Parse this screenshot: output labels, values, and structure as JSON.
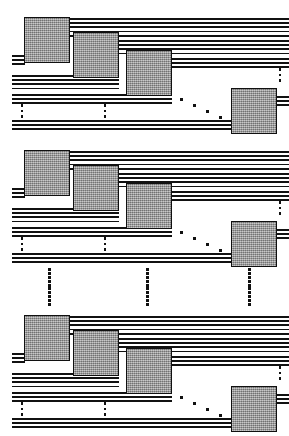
{
  "figure": {
    "type": "schematic-diagram",
    "width": 289,
    "height": 436,
    "background_color": "#ffffff",
    "line_color": "#111111",
    "box_fill_color": "#9a9a9a",
    "box_border_color": "#101010",
    "block_count": 3
  },
  "blocks": [
    {
      "id": "block-1",
      "label": "Stage 1",
      "y": 10,
      "height": 122,
      "boxes": [
        {
          "id": "pe-1-1",
          "label": "PE 1",
          "x": 24,
          "y": 7,
          "w": 46,
          "h": 46
        },
        {
          "id": "pe-1-2",
          "label": "PE 2",
          "x": 73,
          "y": 22,
          "w": 46,
          "h": 46
        },
        {
          "id": "pe-1-3",
          "label": "PE 3",
          "x": 126,
          "y": 40,
          "w": 46,
          "h": 46
        },
        {
          "id": "pe-1-4",
          "label": "PE n",
          "x": 231,
          "y": 78,
          "w": 46,
          "h": 46
        }
      ],
      "bus_groups": [
        {
          "id": "bus-top-1",
          "label": "Top bus group",
          "lines": 5,
          "x": 70,
          "y": 8,
          "w": 219,
          "spacing": 4.2
        },
        {
          "id": "bus-mid-1",
          "label": "Second bus group",
          "lines": 4,
          "x": 119,
          "y": 30,
          "w": 170,
          "spacing": 4.2
        },
        {
          "id": "bus-third-1",
          "label": "Third bus group",
          "lines": 3,
          "x": 172,
          "y": 48,
          "w": 117,
          "spacing": 4.2
        },
        {
          "id": "bus-left-1",
          "label": "Return bus group",
          "lines": 4,
          "x": 12,
          "y": 65,
          "w": 107,
          "spacing": 4.2
        },
        {
          "id": "bus-low-1",
          "label": "Lower bus group",
          "lines": 3,
          "x": 12,
          "y": 84,
          "w": 160,
          "spacing": 4.2
        },
        {
          "id": "bus-bottom-1",
          "label": "Bottom bus group",
          "lines": 3,
          "x": 12,
          "y": 110,
          "w": 219,
          "spacing": 4.2
        }
      ],
      "left_stubs": {
        "id": "stubs-left-1",
        "label": "Left input stubs",
        "lines": 3,
        "x": 12,
        "y": 45,
        "w": 13,
        "spacing": 4.2
      },
      "right_stubs": {
        "id": "stubs-right-1",
        "label": "Right output stubs",
        "lines": 3,
        "x": 277,
        "y": 86,
        "w": 12,
        "spacing": 4.2
      },
      "diag_ellipsis": {
        "id": "diag-dots-1",
        "label": "Horizontal continuation dots",
        "x": 180,
        "y": 88,
        "count": 4
      },
      "vert_ellipsis": [
        {
          "id": "vdots-1-a",
          "label": "Bus continuation dots left",
          "x": 20,
          "y": 94,
          "h": 14,
          "count": 3
        },
        {
          "id": "vdots-1-b",
          "label": "Bus continuation dots mid",
          "x": 103,
          "y": 94,
          "h": 14,
          "count": 3
        },
        {
          "id": "vdots-1-c",
          "label": "Bus continuation dots right",
          "x": 278,
          "y": 58,
          "h": 14,
          "count": 3
        }
      ]
    },
    {
      "id": "block-2",
      "label": "Stage 2",
      "y": 143,
      "height": 122,
      "boxes": [
        {
          "id": "pe-2-1",
          "label": "PE 1",
          "x": 24,
          "y": 7,
          "w": 46,
          "h": 46
        },
        {
          "id": "pe-2-2",
          "label": "PE 2",
          "x": 73,
          "y": 22,
          "w": 46,
          "h": 46
        },
        {
          "id": "pe-2-3",
          "label": "PE 3",
          "x": 126,
          "y": 40,
          "w": 46,
          "h": 46
        },
        {
          "id": "pe-2-4",
          "label": "PE n",
          "x": 231,
          "y": 78,
          "w": 46,
          "h": 46
        }
      ],
      "bus_groups": [
        {
          "id": "bus-top-2",
          "label": "Top bus group",
          "lines": 5,
          "x": 70,
          "y": 8,
          "w": 219,
          "spacing": 4.2
        },
        {
          "id": "bus-mid-2",
          "label": "Second bus group",
          "lines": 4,
          "x": 119,
          "y": 30,
          "w": 170,
          "spacing": 4.2
        },
        {
          "id": "bus-third-2",
          "label": "Third bus group",
          "lines": 3,
          "x": 172,
          "y": 48,
          "w": 117,
          "spacing": 4.2
        },
        {
          "id": "bus-left-2",
          "label": "Return bus group",
          "lines": 4,
          "x": 12,
          "y": 65,
          "w": 107,
          "spacing": 4.2
        },
        {
          "id": "bus-low-2",
          "label": "Lower bus group",
          "lines": 3,
          "x": 12,
          "y": 84,
          "w": 160,
          "spacing": 4.2
        },
        {
          "id": "bus-bottom-2",
          "label": "Bottom bus group",
          "lines": 3,
          "x": 12,
          "y": 110,
          "w": 219,
          "spacing": 4.2
        }
      ],
      "left_stubs": {
        "id": "stubs-left-2",
        "label": "Left input stubs",
        "lines": 3,
        "x": 12,
        "y": 45,
        "w": 13,
        "spacing": 4.2
      },
      "right_stubs": {
        "id": "stubs-right-2",
        "label": "Right output stubs",
        "lines": 3,
        "x": 277,
        "y": 86,
        "w": 12,
        "spacing": 4.2
      },
      "diag_ellipsis": {
        "id": "diag-dots-2",
        "label": "Horizontal continuation dots",
        "x": 180,
        "y": 88,
        "count": 4
      },
      "vert_ellipsis": [
        {
          "id": "vdots-2-a",
          "label": "Bus continuation dots left",
          "x": 20,
          "y": 94,
          "h": 14,
          "count": 3
        },
        {
          "id": "vdots-2-b",
          "label": "Bus continuation dots mid",
          "x": 103,
          "y": 94,
          "h": 14,
          "count": 3
        },
        {
          "id": "vdots-2-c",
          "label": "Bus continuation dots right",
          "x": 278,
          "y": 58,
          "h": 14,
          "count": 3
        }
      ]
    },
    {
      "id": "block-3",
      "label": "Stage m",
      "y": 308,
      "height": 122,
      "boxes": [
        {
          "id": "pe-3-1",
          "label": "PE 1",
          "x": 24,
          "y": 7,
          "w": 46,
          "h": 46
        },
        {
          "id": "pe-3-2",
          "label": "PE 2",
          "x": 73,
          "y": 22,
          "w": 46,
          "h": 46
        },
        {
          "id": "pe-3-3",
          "label": "PE 3",
          "x": 126,
          "y": 40,
          "w": 46,
          "h": 46
        },
        {
          "id": "pe-3-4",
          "label": "PE n",
          "x": 231,
          "y": 78,
          "w": 46,
          "h": 46
        }
      ],
      "bus_groups": [
        {
          "id": "bus-top-3",
          "label": "Top bus group",
          "lines": 5,
          "x": 70,
          "y": 8,
          "w": 219,
          "spacing": 4.2
        },
        {
          "id": "bus-mid-3",
          "label": "Second bus group",
          "lines": 4,
          "x": 119,
          "y": 30,
          "w": 170,
          "spacing": 4.2
        },
        {
          "id": "bus-third-3",
          "label": "Third bus group",
          "lines": 3,
          "x": 172,
          "y": 48,
          "w": 117,
          "spacing": 4.2
        },
        {
          "id": "bus-left-3",
          "label": "Return bus group",
          "lines": 4,
          "x": 12,
          "y": 65,
          "w": 107,
          "spacing": 4.2
        },
        {
          "id": "bus-low-3",
          "label": "Lower bus group",
          "lines": 3,
          "x": 12,
          "y": 84,
          "w": 160,
          "spacing": 4.2
        },
        {
          "id": "bus-bottom-3",
          "label": "Bottom bus group",
          "lines": 3,
          "x": 12,
          "y": 110,
          "w": 219,
          "spacing": 4.2
        }
      ],
      "left_stubs": {
        "id": "stubs-left-3",
        "label": "Left input stubs",
        "lines": 3,
        "x": 12,
        "y": 45,
        "w": 13,
        "spacing": 4.2
      },
      "right_stubs": {
        "id": "stubs-right-3",
        "label": "Right output stubs",
        "lines": 3,
        "x": 277,
        "y": 86,
        "w": 12,
        "spacing": 4.2
      },
      "diag_ellipsis": {
        "id": "diag-dots-3",
        "label": "Horizontal continuation dots",
        "x": 180,
        "y": 88,
        "count": 4
      },
      "vert_ellipsis": [
        {
          "id": "vdots-3-a",
          "label": "Bus continuation dots left",
          "x": 20,
          "y": 94,
          "h": 14,
          "count": 3
        },
        {
          "id": "vdots-3-b",
          "label": "Bus continuation dots mid",
          "x": 103,
          "y": 94,
          "h": 14,
          "count": 3
        },
        {
          "id": "vdots-3-c",
          "label": "Bus continuation dots right",
          "x": 278,
          "y": 58,
          "h": 14,
          "count": 3
        }
      ]
    }
  ],
  "block_separator": {
    "id": "stage-separator",
    "label": "Stage repetition ellipsis",
    "y": 268,
    "height": 38,
    "dot_count": 10,
    "columns": [
      {
        "id": "sep-col-left",
        "label": "Separator dots left",
        "x": 47
      },
      {
        "id": "sep-col-mid",
        "label": "Separator dots middle",
        "x": 145
      },
      {
        "id": "sep-col-right",
        "label": "Separator dots right",
        "x": 247
      }
    ]
  }
}
